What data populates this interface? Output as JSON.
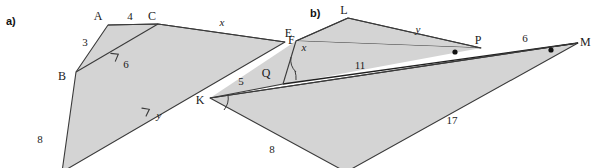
{
  "figure": {
    "background_color": "#ffffff",
    "shape_fill_color": "#d4d4d4",
    "stroke_color": "#3a3a3a",
    "text_color": "#1a1a1a"
  },
  "parts": [
    {
      "part_label": "a)",
      "vertices": [
        {
          "name": "A",
          "x": 108,
          "y": 25
        },
        {
          "name": "C",
          "x": 158,
          "y": 24
        },
        {
          "name": "E",
          "x": 285,
          "y": 42
        },
        {
          "name": "B",
          "x": 76,
          "y": 72
        },
        {
          "name": "D",
          "x": 62,
          "y": 170
        }
      ],
      "vertex_labels": [
        {
          "text": "A",
          "x": 98,
          "y": 20
        },
        {
          "text": "C",
          "x": 152,
          "y": 20
        },
        {
          "text": "E",
          "x": 288,
          "y": 44
        },
        {
          "text": "B",
          "x": 62,
          "y": 80
        }
      ],
      "measures": [
        {
          "text": "3",
          "x": 85,
          "y": 46,
          "kind": "number",
          "segment": "AB"
        },
        {
          "text": "4",
          "x": 130,
          "y": 20,
          "kind": "number",
          "segment": "AC"
        },
        {
          "text": "6",
          "x": 123,
          "y": 65,
          "kind": "number",
          "segment": "BC"
        },
        {
          "text": "8",
          "x": 40,
          "y": 140,
          "kind": "number",
          "segment": "BD"
        },
        {
          "text": "x",
          "x": 222,
          "y": 26,
          "kind": "variable",
          "segment": "CE"
        },
        {
          "text": "y",
          "x": 158,
          "y": 118,
          "kind": "variable",
          "segment": "DE"
        }
      ],
      "parallel_ticks": [
        {
          "on_segment": "BC",
          "x": 115,
          "y": 57
        },
        {
          "on_segment": "DE",
          "x": 150,
          "y": 110
        }
      ]
    },
    {
      "part_label": "b)",
      "vertices": [
        {
          "name": "E",
          "x": 296,
          "y": 41
        },
        {
          "name": "L",
          "x": 348,
          "y": 18
        },
        {
          "name": "P",
          "x": 481,
          "y": 48
        },
        {
          "name": "M",
          "x": 578,
          "y": 43
        },
        {
          "name": "K",
          "x": 210,
          "y": 98
        },
        {
          "name": "Q",
          "x": 272,
          "y": 80
        },
        {
          "name": "N",
          "x": 346,
          "y": 170
        }
      ],
      "vertex_labels": [
        {
          "text": "L",
          "x": 344,
          "y": 14
        },
        {
          "text": "P",
          "x": 478,
          "y": 44
        },
        {
          "text": "M",
          "x": 580,
          "y": 45
        },
        {
          "text": "K",
          "x": 200,
          "y": 103
        },
        {
          "text": "Q",
          "x": 264,
          "y": 77
        }
      ],
      "measures": [
        {
          "text": "x",
          "x": 306,
          "y": 48,
          "kind": "variable",
          "segment": "EL"
        },
        {
          "text": "y",
          "x": 418,
          "y": 33,
          "kind": "variable",
          "segment": "LP"
        },
        {
          "text": "11",
          "x": 358,
          "y": 67,
          "kind": "number",
          "segment": "QP"
        },
        {
          "text": "6",
          "x": 525,
          "y": 44,
          "kind": "number",
          "segment": "PM"
        },
        {
          "text": "17",
          "x": 450,
          "y": 122,
          "kind": "number",
          "segment": "NM"
        },
        {
          "text": "5",
          "x": 240,
          "y": 84,
          "kind": "number",
          "segment": "KQ"
        },
        {
          "text": "8",
          "x": 270,
          "y": 150,
          "kind": "number",
          "segment": "KN"
        }
      ],
      "angle_arcs": [
        {
          "at_vertex": "E",
          "cx": 296,
          "cy": 41
        },
        {
          "at_vertex": "K",
          "cx": 210,
          "cy": 98
        },
        {
          "at_vertex": "Q",
          "cx": 272,
          "cy": 80
        }
      ],
      "point_markers": [
        {
          "x": 455,
          "y": 52,
          "label": "marker-near-P"
        },
        {
          "x": 551,
          "y": 50,
          "label": "marker-near-M"
        }
      ]
    }
  ]
}
